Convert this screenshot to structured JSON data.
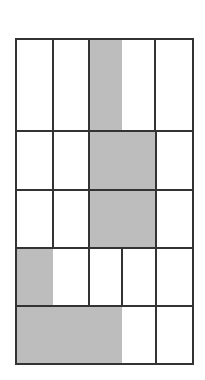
{
  "figure": {
    "type": "grid-shading-diagram",
    "width": 205,
    "height": 380,
    "colors": {
      "background": "#ffffff",
      "shade": "#bdbdbd",
      "line": "#333333"
    },
    "line_width": 2,
    "columns_x": [
      16,
      53,
      89,
      122,
      156,
      193
    ],
    "rows_y": [
      39,
      131,
      190,
      248,
      306,
      364
    ],
    "rows": [
      {
        "index": 1,
        "y0": 39,
        "y1": 131,
        "vertical_lines": [
          53,
          89,
          155
        ],
        "shaded": [
          {
            "x0": 89,
            "x1": 122
          }
        ]
      },
      {
        "index": 2,
        "y0": 131,
        "y1": 190,
        "vertical_lines": [
          53,
          89,
          156
        ],
        "shaded": [
          {
            "x0": 89,
            "x1": 156
          }
        ]
      },
      {
        "index": 3,
        "y0": 190,
        "y1": 248,
        "vertical_lines": [
          53,
          89,
          156
        ],
        "shaded": [
          {
            "x0": 89,
            "x1": 156
          }
        ]
      },
      {
        "index": 4,
        "y0": 248,
        "y1": 306,
        "vertical_lines": [
          89,
          122,
          156
        ],
        "shaded": [
          {
            "x0": 16,
            "x1": 53
          }
        ]
      },
      {
        "index": 5,
        "y0": 306,
        "y1": 364,
        "vertical_lines": [
          156
        ],
        "shaded": [
          {
            "x0": 16,
            "x1": 122
          }
        ]
      }
    ]
  }
}
